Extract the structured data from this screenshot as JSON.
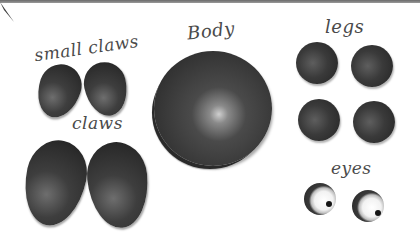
{
  "labels": {
    "small_claws": "small claws",
    "claws": "claws",
    "body": "Body",
    "legs": "legs",
    "eyes": "eyes"
  },
  "pieces": {
    "small_claws_count": 2,
    "claws_count": 2,
    "body_count": 1,
    "legs_count": 4,
    "eyes_count": 2
  },
  "colors": {
    "clay": "#2e2e2e",
    "label_ink": "#4a4a4a",
    "background": "#ffffff",
    "eye_white": "#f2f2f2"
  }
}
